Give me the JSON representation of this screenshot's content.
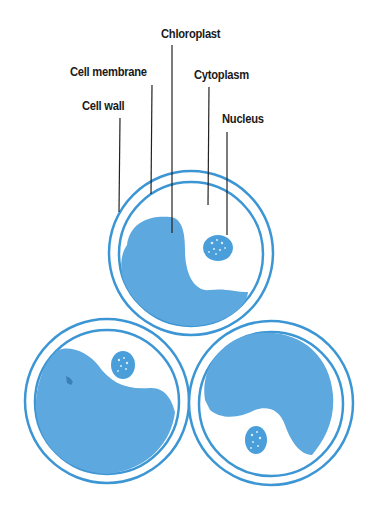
{
  "colors": {
    "cell_outline": "#3d96d4",
    "cytoplasm_fill": "#ffffff",
    "chloroplast_fill": "#5da8de",
    "nucleus_fill": "#4a9fdb",
    "leader_line": "#222222",
    "label_text": "#1a1a1a"
  },
  "labels": [
    {
      "id": "chloroplast",
      "text": "Chloroplast"
    },
    {
      "id": "cell-membrane",
      "text": "Cell membrane"
    },
    {
      "id": "cytoplasm",
      "text": "Cytoplasm"
    },
    {
      "id": "cell-wall",
      "text": "Cell wall"
    },
    {
      "id": "nucleus",
      "text": "Nucleus"
    }
  ],
  "cells": [
    {
      "id": "top-cell",
      "labeled": true
    },
    {
      "id": "bottom-left-cell",
      "labeled": false
    },
    {
      "id": "bottom-right-cell",
      "labeled": false
    }
  ]
}
